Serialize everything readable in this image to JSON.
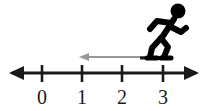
{
  "figure": {
    "background_color": "#ffffff"
  },
  "number_line": {
    "name": "horizontal-number-line",
    "axis_color": "#1a1a1a",
    "axis_y": 73,
    "left_arrow_x": 12,
    "right_arrow_x": 196,
    "has_left_arrowhead": true,
    "has_right_arrowhead": true,
    "tick_color": "#1a1a1a",
    "label_color": "#1a1a1a",
    "ticks": [
      {
        "label": "0",
        "value": 0,
        "x": 42
      },
      {
        "label": "1",
        "value": 1,
        "x": 82
      },
      {
        "label": "2",
        "value": 2,
        "x": 122
      },
      {
        "label": "3",
        "value": 3,
        "x": 163
      }
    ],
    "tick_top": 65,
    "tick_bottom": 82,
    "label_baseline_y": 104
  },
  "displacement_arrow": {
    "name": "leftward-displacement-arrow",
    "color": "#999999",
    "direction": "left",
    "start_value": 3,
    "end_value": 1.1,
    "start_x": 163,
    "end_x": 79,
    "y": 57,
    "stroke_width": 2
  },
  "ground_line": {
    "name": "ground-platform-line",
    "color": "#1a1a1a",
    "x1": 140,
    "x2": 166,
    "y": 58,
    "stroke_width": 3
  },
  "stick_figure": {
    "name": "walking-stick-figure",
    "color": "#000000",
    "facing": "right",
    "pose": "walking-stride",
    "head": {
      "cx": 178,
      "cy": 11,
      "r": 7.5
    },
    "torso": {
      "x1": 173,
      "y1": 20,
      "x2": 160,
      "y2": 38
    },
    "arm_back": {
      "points": "172,23 158,22 151,28"
    },
    "arm_front": {
      "points": "168,27 180,32 185,29"
    },
    "leg_back": {
      "points": "161,37 152,48 149,57"
    },
    "leg_front": {
      "points": "161,37 167,47 163,57"
    },
    "bounding_box": {
      "x": 146,
      "y": 3,
      "width": 42,
      "height": 56
    }
  },
  "chart_data": {
    "type": "line",
    "xlabel": "",
    "ylabel": "",
    "categories": [
      "0",
      "1",
      "2",
      "3"
    ],
    "x": [
      0,
      1,
      2,
      3
    ],
    "xlim": [
      -0.75,
      3.85
    ],
    "grid": false,
    "legend": null,
    "annotations": [
      {
        "name": "displacement-arrow",
        "type": "arrow",
        "from_x": 3,
        "to_x": 1.1,
        "direction": "left",
        "color": "#999999"
      },
      {
        "name": "walking-figure",
        "type": "icon",
        "at_x": 3,
        "facing": "right",
        "color": "#000000"
      }
    ]
  }
}
